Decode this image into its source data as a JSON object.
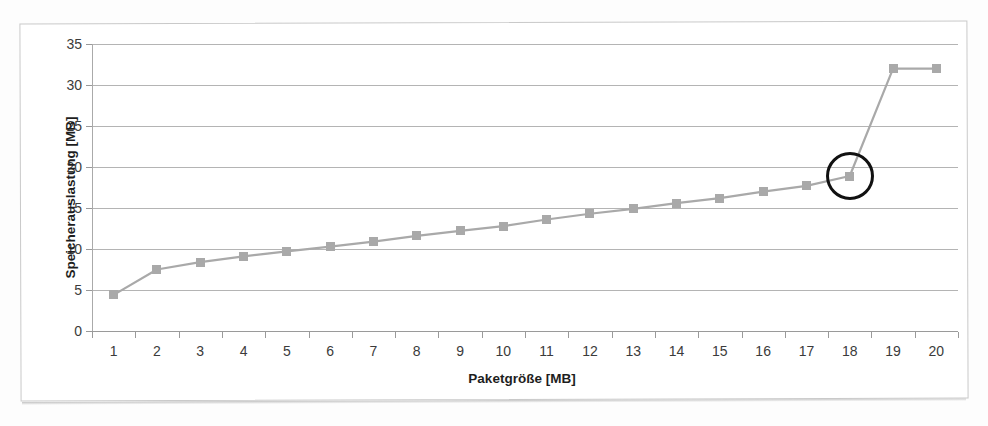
{
  "chart_data": {
    "type": "line",
    "title": "",
    "xlabel": "Paketgröße [MB]",
    "ylabel": "Speicherauslastung [MB]",
    "categories": [
      "1",
      "2",
      "3",
      "4",
      "5",
      "6",
      "7",
      "8",
      "9",
      "10",
      "11",
      "12",
      "13",
      "14",
      "15",
      "16",
      "17",
      "18",
      "19",
      "20"
    ],
    "x": [
      1,
      2,
      3,
      4,
      5,
      6,
      7,
      8,
      9,
      10,
      11,
      12,
      13,
      14,
      15,
      16,
      17,
      18,
      19,
      20
    ],
    "values": [
      4.4,
      7.5,
      8.4,
      9.1,
      9.7,
      10.3,
      10.9,
      11.6,
      12.2,
      12.8,
      13.6,
      14.3,
      14.9,
      15.6,
      16.2,
      17.0,
      17.7,
      18.9,
      32.0,
      32.0
    ],
    "series": [
      {
        "name": "Speicherauslastung",
        "values": [
          4.4,
          7.5,
          8.4,
          9.1,
          9.7,
          10.3,
          10.9,
          11.6,
          12.2,
          12.8,
          13.6,
          14.3,
          14.9,
          15.6,
          16.2,
          17.0,
          17.7,
          18.9,
          32.0,
          32.0
        ]
      }
    ],
    "ylim": [
      0,
      35
    ],
    "yticks": [
      0,
      5,
      10,
      15,
      20,
      25,
      30,
      35
    ],
    "ytick_labels": [
      "0",
      "5",
      "10",
      "15",
      "20",
      "25",
      "30",
      "35"
    ],
    "xlim": [
      0.5,
      20.5
    ],
    "grid": "horizontal",
    "legend": "none",
    "line_color": "#a9a9a9",
    "marker_color": "#a9a9a9",
    "marker_shape": "square",
    "gridline_color": "#b4b4b4",
    "annotations": [
      {
        "type": "circle",
        "label": "highlight-circle-point-18",
        "target_x": 18,
        "target_y": 18.9,
        "color": "#111111"
      }
    ]
  }
}
